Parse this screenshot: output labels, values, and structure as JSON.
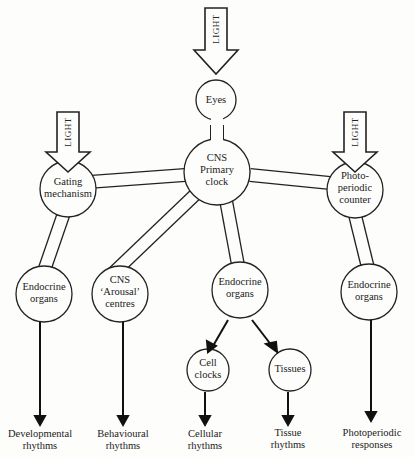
{
  "diagram": {
    "light_label": "LIGHT",
    "nodes": {
      "eyes": "Eyes",
      "cns_primary": [
        "CNS",
        "Primary",
        "clock"
      ],
      "gating": [
        "Gating",
        "mechanism"
      ],
      "photo_counter": [
        "Photo-",
        "periodic",
        "counter"
      ],
      "endo_left": [
        "Endocrine",
        "organs"
      ],
      "cns_arousal": [
        "CNS",
        "‘Arousal’",
        "centres"
      ],
      "endo_mid": [
        "Endocrine",
        "organs"
      ],
      "endo_right": [
        "Endocrine",
        "organs"
      ],
      "cell_clocks": [
        "Cell",
        "clocks"
      ],
      "tissues": "Tissues"
    },
    "outputs": {
      "developmental": [
        "Developmental",
        "rhythms"
      ],
      "behavioural": [
        "Behavioural",
        "rhythms"
      ],
      "cellular": [
        "Cellular",
        "rhythms"
      ],
      "tissue": [
        "Tissue",
        "rhythms"
      ],
      "photoperiodic": [
        "Photoperiodic",
        "responses"
      ]
    }
  }
}
